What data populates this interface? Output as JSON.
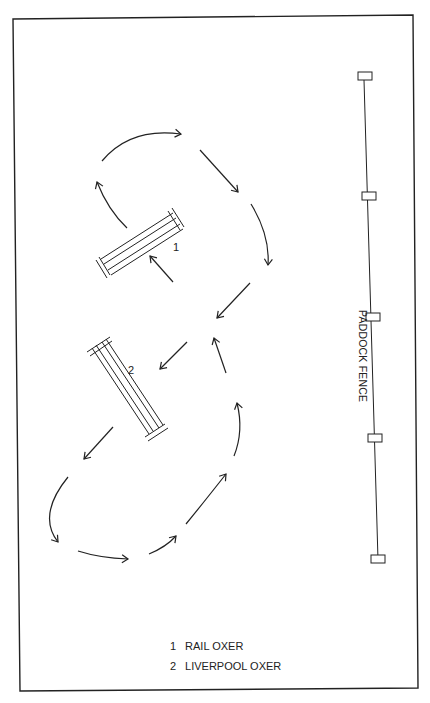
{
  "diagram": {
    "fence": {
      "label": "PADDOCK FENCE",
      "posts": 5
    },
    "jumps": [
      {
        "number": "1",
        "name": "RAIL OXER"
      },
      {
        "number": "2",
        "name": "LIVERPOOL OXER"
      }
    ],
    "legend": [
      {
        "number": "1",
        "label": "RAIL OXER"
      },
      {
        "number": "2",
        "label": "LIVERPOOL OXER"
      }
    ],
    "colors": {
      "line": "#222222",
      "background": "#ffffff"
    }
  }
}
